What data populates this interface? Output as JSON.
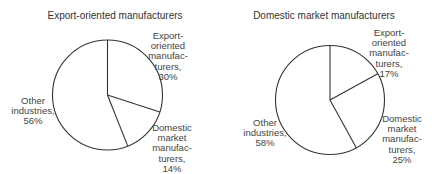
{
  "chart_data": [
    {
      "type": "pie",
      "title": "Export-oriented manufacturers",
      "categories": [
        "Export-oriented manufacturers",
        "Domestic market manufacturers",
        "Other industries"
      ],
      "values": [
        30,
        14,
        56
      ],
      "unit": "%",
      "labels": [
        "Export-\noriented\nmanufac-\nturers,\n30%",
        "Domestic\nmarket\nmanufac-\nturers,\n14%",
        "Other\nindustries,\n56%"
      ],
      "start_angle_deg": 0,
      "direction": "clockwise",
      "fill": "#ffffff",
      "stroke": "#333333"
    },
    {
      "type": "pie",
      "title": "Domestic market manufacturers",
      "categories": [
        "Export-oriented manufacturers",
        "Domestic market manufacturers",
        "Other industries"
      ],
      "values": [
        17,
        25,
        58
      ],
      "unit": "%",
      "labels": [
        "Export-\noriented\nmanufac-\nturers,\n17%",
        "Domestic\nmarket\nmanufac-\nturers,\n25%",
        "Other\nindustries,\n58%"
      ],
      "start_angle_deg": 0,
      "direction": "clockwise",
      "fill": "#ffffff",
      "stroke": "#333333"
    }
  ]
}
